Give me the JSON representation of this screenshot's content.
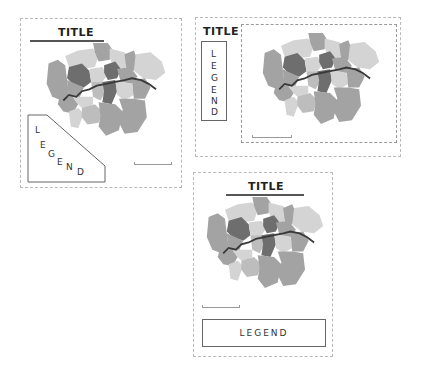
{
  "layouts": [
    {
      "id": "layout-1",
      "title": "TITLE",
      "legend": {
        "text": "LEGEND",
        "orientation": "diagonal",
        "letters": [
          "L",
          "E",
          "G",
          "E",
          "N",
          "D"
        ]
      }
    },
    {
      "id": "layout-2",
      "title": "TITLE",
      "legend": {
        "text": "LEGEND",
        "orientation": "vertical",
        "letters": [
          "L",
          "E",
          "G",
          "E",
          "N",
          "D"
        ]
      }
    },
    {
      "id": "layout-3",
      "title": "TITLE",
      "legend": {
        "text": "LEGEND",
        "orientation": "horizontal"
      }
    }
  ],
  "map_colors": {
    "light": "#d4d4d4",
    "mid": "#a3a3a3",
    "midlight": "#bdbdbd",
    "dark": "#6e6e6e",
    "darkest": "#555555",
    "river": "#3a3a3a"
  }
}
